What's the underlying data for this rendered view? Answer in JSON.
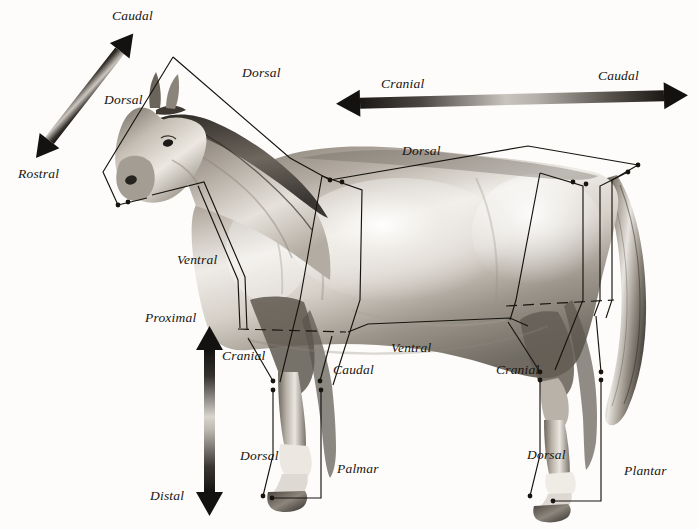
{
  "figure": {
    "background_color": "#fdfcfa",
    "line_color": "#17140f",
    "label_style": "italic-serif"
  },
  "axes": [
    {
      "id": "rostral-caudal",
      "orientation": "diagonal",
      "start_label": "Rostral",
      "end_label": "Caudal",
      "start_pos": {
        "x": 36,
        "y": 158
      },
      "end_pos": {
        "x": 133,
        "y": 34
      },
      "label_start_pos": {
        "x": 18,
        "y": 170
      },
      "label_end_pos": {
        "x": 112,
        "y": 10
      },
      "gradient": "dark-light-dark"
    },
    {
      "id": "cranial-caudal",
      "orientation": "horizontal",
      "start_label": "Cranial",
      "end_label": "Caudal",
      "start_pos": {
        "x": 338,
        "y": 103
      },
      "end_pos": {
        "x": 686,
        "y": 94
      },
      "label_start_pos": {
        "x": 381,
        "y": 78
      },
      "label_end_pos": {
        "x": 598,
        "y": 70
      },
      "gradient": "dark-light-dark"
    },
    {
      "id": "proximal-distal",
      "orientation": "vertical",
      "start_label": "Proximal",
      "end_label": "Distal",
      "start_pos": {
        "x": 210,
        "y": 332
      },
      "end_pos": {
        "x": 210,
        "y": 508
      },
      "label_start_pos": {
        "x": 145,
        "y": 312
      },
      "label_end_pos": {
        "x": 150,
        "y": 490
      },
      "gradient": "dark-light-dark"
    }
  ],
  "regions": [
    {
      "id": "head",
      "name": "head",
      "labels": [
        {
          "text": "Dorsal",
          "x": 104,
          "y": 92,
          "side": "dorsal"
        }
      ]
    },
    {
      "id": "neck",
      "name": "neck",
      "labels": [
        {
          "text": "Dorsal",
          "x": 242,
          "y": 65,
          "side": "dorsal"
        },
        {
          "text": "Ventral",
          "x": 177,
          "y": 252,
          "side": "ventral"
        }
      ]
    },
    {
      "id": "trunk",
      "name": "trunk",
      "labels": [
        {
          "text": "Dorsal",
          "x": 402,
          "y": 143,
          "side": "dorsal"
        },
        {
          "text": "Ventral",
          "x": 391,
          "y": 340,
          "side": "ventral"
        },
        {
          "text": "Cranial",
          "x": 222,
          "y": 348,
          "side": "cranial"
        },
        {
          "text": "Caudal",
          "x": 333,
          "y": 366,
          "side": "caudal"
        }
      ]
    },
    {
      "id": "forelimb",
      "name": "forelimb",
      "labels": [
        {
          "text": "Dorsal",
          "x": 240,
          "y": 450,
          "side": "dorsal"
        },
        {
          "text": "Palmar",
          "x": 337,
          "y": 463,
          "side": "palmar"
        }
      ]
    },
    {
      "id": "hindlimb",
      "name": "hindlimb",
      "labels": [
        {
          "text": "Cranial",
          "x": 496,
          "y": 365,
          "side": "cranial"
        },
        {
          "text": "Dorsal",
          "x": 527,
          "y": 449,
          "side": "dorsal"
        },
        {
          "text": "Plantar",
          "x": 624,
          "y": 465,
          "side": "plantar"
        }
      ]
    }
  ],
  "all_labels": [
    "Caudal",
    "Dorsal",
    "Dorsal",
    "Rostral",
    "Cranial",
    "Caudal",
    "Dorsal",
    "Ventral",
    "Proximal",
    "Cranial",
    "Caudal",
    "Ventral",
    "Dorsal",
    "Palmar",
    "Cranial",
    "Dorsal",
    "Plantar",
    "Distal"
  ]
}
